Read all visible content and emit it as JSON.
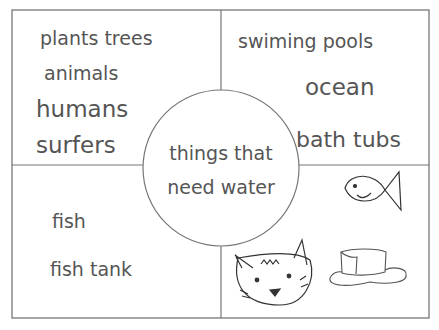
{
  "diagram": {
    "type": "circle-quadrant graphic organizer",
    "center_label": {
      "line1": "things that",
      "line2": "need water"
    },
    "quadrants": {
      "top_left": {
        "items": [
          "plants trees",
          "animals",
          "humans",
          "surfers"
        ]
      },
      "top_right": {
        "items": [
          "swiming pools",
          "ocean",
          "bath tubs"
        ]
      },
      "bottom_left": {
        "items": [
          "fish",
          "fish tank"
        ]
      },
      "bottom_right": {
        "drawings": [
          "fish-drawing",
          "cat-drawing",
          "melting-ice-cube-drawing"
        ]
      }
    },
    "colors": {
      "line": "#777777",
      "text": "#555555",
      "background": "#ffffff"
    }
  }
}
